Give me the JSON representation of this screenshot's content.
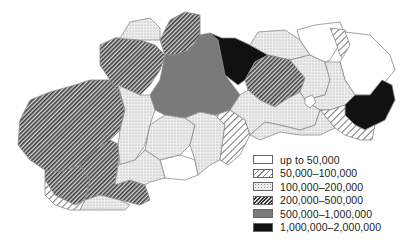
{
  "map": {
    "subject": "Slovakia districts choropleth",
    "colors": {
      "border": "#8a8a8a",
      "dotted_bg": "#e6e6e6",
      "medium_gray": "#7a7a7a",
      "black": "#111111"
    }
  },
  "legend": {
    "items": [
      {
        "label": "up to 50,000",
        "fill": "empty"
      },
      {
        "label": "50,000–100,000",
        "fill": "light-hatch"
      },
      {
        "label": "100,000–200,000",
        "fill": "dotted"
      },
      {
        "label": "200,000–500,000",
        "fill": "dense-hatch"
      },
      {
        "label": "500,000–1,000,000",
        "fill": "gray"
      },
      {
        "label": "1,000,000–2,000,000",
        "fill": "black"
      }
    ]
  }
}
